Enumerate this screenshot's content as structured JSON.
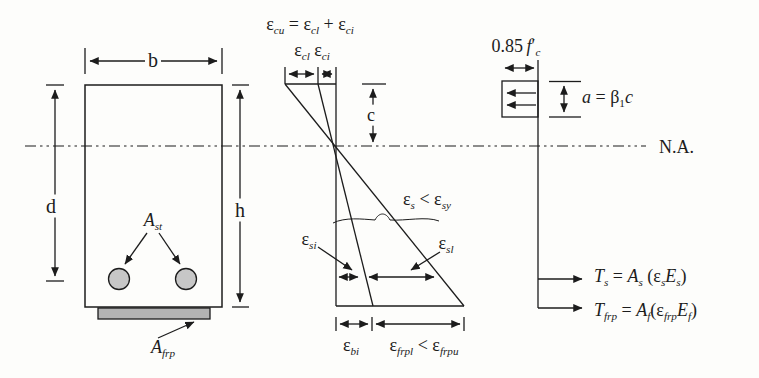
{
  "figure": {
    "colors": {
      "ink": "#1c1c1c",
      "paper": "#fdfdfb",
      "steel_fill": "#c7c7c7",
      "frp_fill": "#b3b3b3"
    }
  },
  "beam": {
    "width_label": "b",
    "effective_depth_label": "d",
    "height_label": "h",
    "steel_area_label_html": "<i>A</i><sub><i>st</i></sub>",
    "frp_area_label_html": "<i>A</i><sub><i>frp</i></sub>"
  },
  "strain_diagram": {
    "top_strain_eq_html": "ε<sub><i>cu</i></sub> = ε<sub><i>cl</i></sub> + ε<sub><i>ci</i></sub>",
    "top_strain_parts_html": "ε<sub><i>cl</i></sub> ε<sub><i>ci</i></sub>",
    "neutral_axis_depth_label": "c",
    "steel_strain_check_html": "ε<sub><i>s</i></sub> &lt; ε<sub><i>sy</i></sub>",
    "steel_initial_strain_html": "ε<sub><i>si</i></sub>",
    "steel_live_strain_html": "ε<sub><i>sl</i></sub>",
    "soffit_initial_strain_html": "ε<sub><i>bi</i></sub>",
    "frp_strain_check_html": "ε<sub><i>frpl</i></sub> &lt; ε<sub><i>frpu</i></sub>"
  },
  "stress_diagram": {
    "concrete_stress_html": "0.85 <i>f</i>′<sub><i>c</i></sub>",
    "stress_block_depth_html": "<i>a</i> = β<sub>1</sub><i>c</i>",
    "neutral_axis_label": "N.A.",
    "steel_force_eq_html": "<i>T</i><sub><i>s</i></sub> = <i>A</i><sub><i>s</i></sub> (ε<sub><i>s</i></sub><i>E</i><sub><i>s</i></sub>)",
    "frp_force_eq_html": "<i>T</i><sub><i>frp</i></sub> = <i>A</i><sub><i>f</i></sub>(ε<sub><i>frp</i></sub><i>E</i><sub><i>f</i></sub>)"
  }
}
